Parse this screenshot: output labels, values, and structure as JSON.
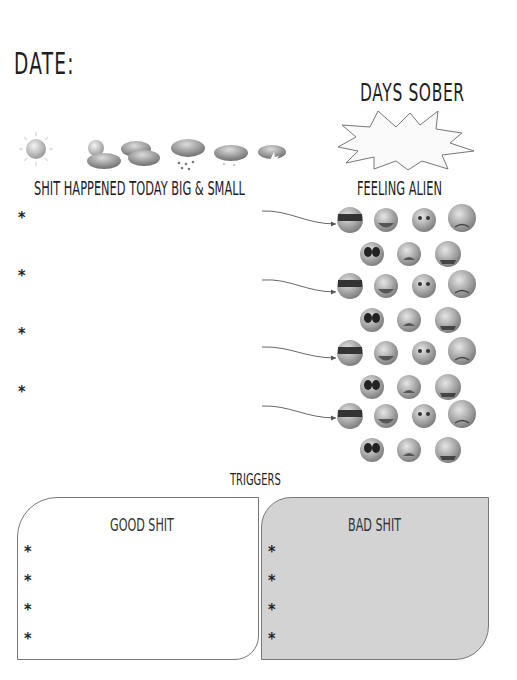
{
  "header": {
    "date_label": "DATE:",
    "days_sober_label": "DAYS SOBER"
  },
  "weather_icons": [
    "sun-icon",
    "partly-cloudy-icon",
    "cloudy-icon",
    "rain-icon",
    "snow-icon",
    "storm-icon"
  ],
  "sections": {
    "shit_happened_title": "SHIT HAPPENED TODAY BIG & SMALL",
    "feeling_title": "FEELING ALIEN",
    "bullet": "*",
    "rows": [
      {
        "bullet": "*"
      },
      {
        "bullet": "*"
      },
      {
        "bullet": "*"
      },
      {
        "bullet": "*"
      }
    ],
    "alien_faces": [
      "cool-sunglasses-alien-icon",
      "laughing-alien-icon",
      "worried-alien-icon",
      "sad-alien-icon",
      "crying-dark-alien-icon",
      "upset-alien-icon",
      "angry-alien-icon"
    ]
  },
  "triggers": {
    "title": "TRIGGERS",
    "good": {
      "title": "GOOD SHIT",
      "items": [
        "*",
        "*",
        "*",
        "*"
      ]
    },
    "bad": {
      "title": "BAD SHIT",
      "items": [
        "*",
        "*",
        "*",
        "*"
      ]
    }
  },
  "colors": {
    "text": "#1e1e1e",
    "bad_box_bg": "#d3d3d3",
    "border": "#777777"
  }
}
